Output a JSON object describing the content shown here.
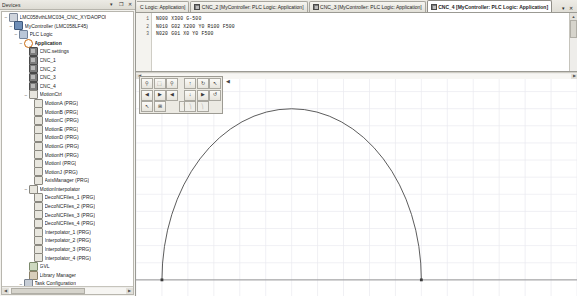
{
  "devices_panel": {
    "title": "Devices",
    "buttons": [
      {
        "name": "panel-pin-button",
        "glyph": "▾"
      },
      {
        "name": "panel-float-button",
        "glyph": "❐"
      },
      {
        "name": "panel-close-button",
        "glyph": "✕"
      }
    ],
    "tree": [
      {
        "label": "LMC058vthLMC034_CNC_XYDAOPOI",
        "depth": 0,
        "icon": "proj",
        "twisty": "−",
        "bold": false
      },
      {
        "label": "MyController (LMC058LF45)",
        "depth": 1,
        "icon": "ctrl",
        "twisty": "−",
        "bold": false
      },
      {
        "label": "PLC Logic",
        "depth": 2,
        "icon": "plc",
        "twisty": "−",
        "bold": false
      },
      {
        "label": "Application",
        "depth": 3,
        "icon": "app",
        "twisty": "−",
        "bold": true
      },
      {
        "label": "CNC.settings",
        "depth": 4,
        "icon": "cnc",
        "twisty": "",
        "bold": false
      },
      {
        "label": "CNC_1",
        "depth": 4,
        "icon": "cnc",
        "twisty": "",
        "bold": false
      },
      {
        "label": "CNC_2",
        "depth": 4,
        "icon": "cnc",
        "twisty": "",
        "bold": false
      },
      {
        "label": "CNC_3",
        "depth": 4,
        "icon": "cnc",
        "twisty": "",
        "bold": false
      },
      {
        "label": "CNC_4",
        "depth": 4,
        "icon": "cnc",
        "twisty": "",
        "bold": false
      },
      {
        "label": "MotionCtrl",
        "depth": 4,
        "icon": "prgm",
        "twisty": "−",
        "bold": false
      },
      {
        "label": "MotionA (PRG)",
        "depth": 5,
        "icon": "prgm",
        "twisty": "",
        "bold": false
      },
      {
        "label": "MotionB (PRG)",
        "depth": 5,
        "icon": "prgm",
        "twisty": "",
        "bold": false
      },
      {
        "label": "MotionC (PRG)",
        "depth": 5,
        "icon": "prgm",
        "twisty": "",
        "bold": false
      },
      {
        "label": "MotionE (PRG)",
        "depth": 5,
        "icon": "prgm",
        "twisty": "",
        "bold": false
      },
      {
        "label": "MotionD (PRG)",
        "depth": 5,
        "icon": "prgm",
        "twisty": "",
        "bold": false
      },
      {
        "label": "MotionG (PRG)",
        "depth": 5,
        "icon": "prgm",
        "twisty": "",
        "bold": false
      },
      {
        "label": "MotionH (PRG)",
        "depth": 5,
        "icon": "prgm",
        "twisty": "",
        "bold": false
      },
      {
        "label": "MotionI (PRG)",
        "depth": 5,
        "icon": "prgm",
        "twisty": "",
        "bold": false
      },
      {
        "label": "MotionJ (PRG)",
        "depth": 5,
        "icon": "prgm",
        "twisty": "",
        "bold": false
      },
      {
        "label": "AxisManager (PRG)",
        "depth": 5,
        "icon": "prgm",
        "twisty": "",
        "bold": false
      },
      {
        "label": "MotionInterpolator",
        "depth": 4,
        "icon": "prgm",
        "twisty": "−",
        "bold": false
      },
      {
        "label": "DecoNCFiles_1 (PRG)",
        "depth": 5,
        "icon": "prgm",
        "twisty": "",
        "bold": false
      },
      {
        "label": "DecoNCFiles_2 (PRG)",
        "depth": 5,
        "icon": "prgm",
        "twisty": "",
        "bold": false
      },
      {
        "label": "DecoNCFiles_3 (PRG)",
        "depth": 5,
        "icon": "prgm",
        "twisty": "",
        "bold": false
      },
      {
        "label": "DecoNCFiles_4 (PRG)",
        "depth": 5,
        "icon": "prgm",
        "twisty": "",
        "bold": false
      },
      {
        "label": "Interpolator_1 (PRG)",
        "depth": 5,
        "icon": "prgm",
        "twisty": "",
        "bold": false
      },
      {
        "label": "Interpolator_2 (PRG)",
        "depth": 5,
        "icon": "prgm",
        "twisty": "",
        "bold": false
      },
      {
        "label": "Interpolator_3 (PRG)",
        "depth": 5,
        "icon": "prgm",
        "twisty": "",
        "bold": false
      },
      {
        "label": "Interpolator_4 (PRG)",
        "depth": 5,
        "icon": "prgm",
        "twisty": "",
        "bold": false
      },
      {
        "label": "GVL",
        "depth": 4,
        "icon": "gvl",
        "twisty": "",
        "bold": false
      },
      {
        "label": "Library Manager",
        "depth": 4,
        "icon": "lib",
        "twisty": "",
        "bold": false
      },
      {
        "label": "Task Configuration",
        "depth": 3,
        "icon": "task",
        "twisty": "−",
        "bold": false
      },
      {
        "label": "DecoNCFiles",
        "depth": 4,
        "icon": "app",
        "twisty": "",
        "bold": false
      },
      {
        "label": "MAST",
        "depth": 4,
        "icon": "app",
        "twisty": "",
        "bold": false
      }
    ],
    "hscroll": {
      "left_glyph": "◀",
      "right_glyph": "▶"
    }
  },
  "tabstrip": {
    "tabs": [
      {
        "label": "C Logic: Application]",
        "active": false,
        "clipped": true,
        "has_icon": false
      },
      {
        "label": "CNC_2 [MyController: PLC Logic: Application]",
        "active": false,
        "clipped": false,
        "has_icon": true
      },
      {
        "label": "CNC_3 [MyController: PLC Logic: Application]",
        "active": false,
        "clipped": false,
        "has_icon": true
      },
      {
        "label": "CNC_4 [MyController: PLC Logic: Application]",
        "active": true,
        "clipped": false,
        "has_icon": true
      }
    ],
    "controls": [
      {
        "name": "tab-list-button",
        "glyph": "▾"
      },
      {
        "name": "tab-close-button",
        "glyph": "✕"
      }
    ]
  },
  "code_editor": {
    "line_numbers": [
      "1",
      "2",
      "3"
    ],
    "lines": [
      "N000 X300 G-500",
      "N010 G02 X200 Y0 R100 F500",
      "N020 G01 X0 Y0 F500"
    ],
    "scrollbar": {
      "up_glyph": "▲",
      "down_glyph": "▼"
    }
  },
  "graph": {
    "hscroll": {
      "left_glyph": "◀",
      "right_glyph": "▶"
    },
    "toolbar": {
      "collapse_glyph": "◀",
      "buttons": [
        {
          "name": "zoom-out-button",
          "glyph": "⚲",
          "disabled": false
        },
        {
          "name": "zoom-fit-button",
          "glyph": "⬚",
          "disabled": false
        },
        {
          "name": "zoom-in-button",
          "glyph": "⚲",
          "disabled": false
        },
        {
          "name": "pan-up-button",
          "glyph": "↑",
          "disabled": false
        },
        {
          "name": "rotate-view-button",
          "glyph": "↻",
          "disabled": false
        },
        {
          "name": "select-tool-button",
          "glyph": "↖",
          "disabled": false
        },
        {
          "name": "pan-left-button",
          "glyph": "◀",
          "disabled": false
        },
        {
          "name": "pan-right-button",
          "glyph": "▶",
          "disabled": false
        },
        {
          "name": "step-back-button",
          "glyph": "◀",
          "disabled": false
        },
        {
          "name": "pan-down-button",
          "glyph": "↓",
          "disabled": false
        },
        {
          "name": "step-forward-button",
          "glyph": "▶",
          "disabled": false
        },
        {
          "name": "reset-view-button",
          "glyph": "↺",
          "disabled": false
        },
        {
          "name": "measure-tool-button",
          "glyph": "↖",
          "disabled": false
        },
        {
          "name": "grid-toggle-button",
          "glyph": "⊞",
          "disabled": false
        },
        {
          "name": "axis-x-button",
          "glyph": "⎞",
          "disabled": true
        },
        {
          "name": "axis-y-button",
          "glyph": "⎞",
          "disabled": true
        },
        {
          "name": "axis-z-button",
          "glyph": "⎞",
          "disabled": true
        }
      ]
    }
  },
  "chart_data": {
    "type": "line",
    "title": "",
    "xlabel": "",
    "ylabel": "",
    "grid": true,
    "legend": null,
    "xlim": [
      -20,
      320
    ],
    "ylim": [
      -10,
      115
    ],
    "series": [
      {
        "name": "Toolpath (G02 circular interpolation)",
        "comment": "Semicircular arc from X=0,Y=0 to X=200,Y=0 with R=100, traversed clockwise over the top",
        "arc": {
          "start": [
            0,
            0
          ],
          "end": [
            200,
            0
          ],
          "radius": 100,
          "sweep": "clockwise-over-top"
        },
        "endpoints": [
          [
            0,
            0
          ],
          [
            200,
            0
          ]
        ],
        "color": "#4a4a4a"
      }
    ]
  }
}
